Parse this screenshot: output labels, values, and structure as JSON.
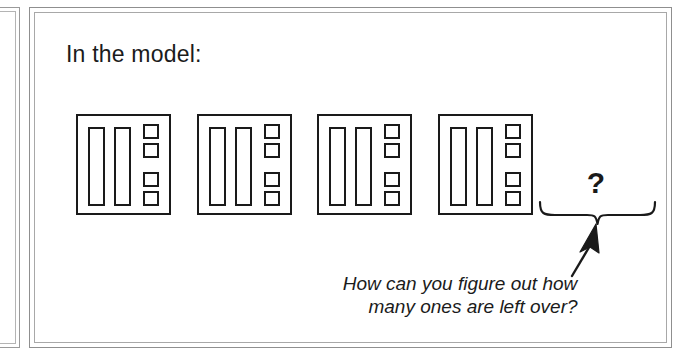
{
  "panel": {
    "heading": "In the model:",
    "border_color": "#8f8f8f",
    "background": "#ffffff"
  },
  "model": {
    "block_count": 4,
    "rods_per_block": 2,
    "units_per_block": 4,
    "ink_color": "#1a1a1a",
    "blocks": [
      {
        "label": "model-block-1",
        "rods": 2,
        "units": 4
      },
      {
        "label": "model-block-2",
        "rods": 2,
        "units": 4
      },
      {
        "label": "model-block-3",
        "rods": 2,
        "units": 4
      },
      {
        "label": "model-block-4",
        "rods": 2,
        "units": 4
      }
    ]
  },
  "annotation": {
    "question_mark": "?",
    "brace": "upward-brace",
    "arrow": "up-arrow",
    "caption_line_1": "How can you figure out how",
    "caption_line_2": "many ones are left over?"
  },
  "edge_panel": {
    "name": "adjacent-cropped-panel"
  }
}
